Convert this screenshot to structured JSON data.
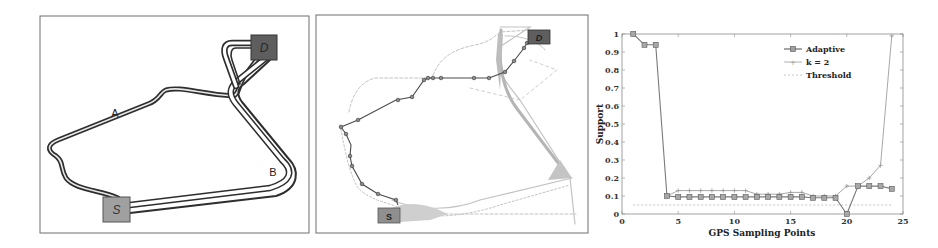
{
  "figure": {
    "panels": [
      {
        "id": "route-diagram",
        "route_labels": [
          "A",
          "B"
        ],
        "source_label": "S",
        "destination_label": "D"
      },
      {
        "id": "trajectory-map",
        "source_label": "S",
        "destination_label": "D"
      },
      {
        "id": "support-chart"
      }
    ]
  },
  "colors": {
    "adaptive": "#7a7a7a",
    "k2": "#a8a8a8",
    "threshold": "#c4c4c4",
    "box_source": "#9a9a9a",
    "box_destination": "#5c5c5c",
    "route_dark": "#333333",
    "cloud": "#bdbdbd"
  },
  "chart_data": {
    "type": "line",
    "title": "",
    "xlabel": "GPS Sampling Points",
    "ylabel": "Support",
    "xlim": [
      0,
      25
    ],
    "ylim": [
      0,
      1
    ],
    "xticks": [
      "0",
      "5",
      "10",
      "15",
      "20",
      "25"
    ],
    "yticks": [
      "0",
      "0.1",
      "0.2",
      "0.3",
      "0.4",
      "0.5",
      "0.6",
      "0.7",
      "0.8",
      "0.9",
      "1"
    ],
    "grid": false,
    "legend_position": "upper right (inside)",
    "series": [
      {
        "name": "Adaptive",
        "marker": "square",
        "x": [
          1,
          2,
          3,
          4,
          5,
          6,
          7,
          8,
          9,
          10,
          11,
          12,
          13,
          14,
          15,
          16,
          17,
          18,
          19,
          20,
          21,
          22,
          23,
          24
        ],
        "values": [
          1.0,
          0.94,
          0.94,
          0.1,
          0.095,
          0.095,
          0.095,
          0.095,
          0.095,
          0.095,
          0.095,
          0.095,
          0.095,
          0.095,
          0.095,
          0.095,
          0.09,
          0.09,
          0.09,
          0.0,
          0.155,
          0.155,
          0.155,
          0.14
        ]
      },
      {
        "name": "k = 2",
        "marker": "plus",
        "x": [
          4,
          5,
          6,
          7,
          8,
          9,
          10,
          11,
          12,
          13,
          14,
          15,
          16,
          17,
          18,
          19,
          20,
          21,
          22,
          23,
          24
        ],
        "values": [
          0.1,
          0.13,
          0.13,
          0.13,
          0.13,
          0.13,
          0.13,
          0.13,
          0.11,
          0.11,
          0.11,
          0.12,
          0.12,
          0.1,
          0.1,
          0.1,
          0.155,
          0.155,
          0.2,
          0.27,
          0.99
        ]
      },
      {
        "name": "Threshold",
        "style": "dashed",
        "x": [
          1,
          24
        ],
        "values": [
          0.05,
          0.05
        ]
      }
    ]
  }
}
